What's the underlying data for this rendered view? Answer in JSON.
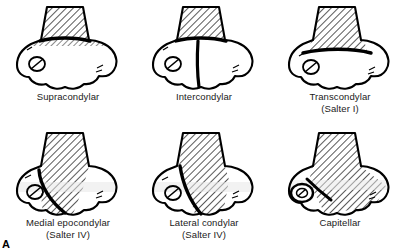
{
  "figure": {
    "letter": "A",
    "panels": [
      {
        "id": "supracondylar",
        "label": "Supracondylar",
        "sublabel": "",
        "fracture_type": "transverse-proximal",
        "has_olecranon_fossa": true,
        "shading": "hatched-shaft"
      },
      {
        "id": "intercondylar",
        "label": "Intercondylar",
        "sublabel": "",
        "fracture_type": "t-shaped-vertical-split",
        "has_olecranon_fossa": true,
        "shading": "hatched-shaft"
      },
      {
        "id": "transcondylar",
        "label": "Transcondylar",
        "sublabel": "(Salter I)",
        "fracture_type": "transverse-distal",
        "has_olecranon_fossa": true,
        "shading": "hatched-shaft"
      },
      {
        "id": "medial-epocondylar",
        "label": "Medial epocondylar",
        "sublabel": "(Salter IV)",
        "fracture_type": "oblique-medial",
        "has_olecranon_fossa": true,
        "shading": "hatched-shaft-oblique"
      },
      {
        "id": "lateral-condylar",
        "label": "Lateral condylar",
        "sublabel": "(Salter IV)",
        "fracture_type": "oblique-lateral",
        "has_olecranon_fossa": true,
        "shading": "hatched-shaft-oblique"
      },
      {
        "id": "capitellar",
        "label": "Capitellar",
        "sublabel": "",
        "fracture_type": "capitellar-fragment",
        "has_olecranon_fossa": false,
        "shading": "hatched-shaft-full"
      }
    ],
    "colors": {
      "ink": "#000000",
      "bone_fill": "#ffffff",
      "hatch": "#000000",
      "shade": "#e8e8e8",
      "background": "#ffffff",
      "caption": "#1a1a1a"
    }
  }
}
